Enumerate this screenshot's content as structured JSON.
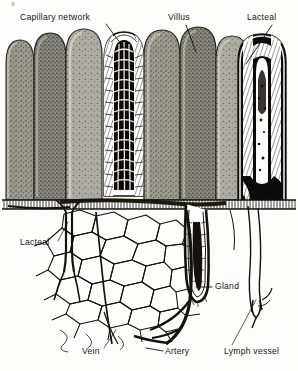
{
  "figure": {
    "kind": "anatomical-illustration",
    "style": "black-and-white engraving / stipple halftone",
    "background_color": "#fdfdfc",
    "ink_color": "#15120c",
    "tissue_gray": "#8d8a83",
    "tissue_gray_light": "#a8a59e",
    "tissue_gray_dark": "#6e6b64"
  },
  "labels": [
    {
      "id": "capillary-network",
      "text": "Capillary network",
      "x": 20,
      "y": 20,
      "anchor": "start"
    },
    {
      "id": "villus",
      "text": "Villus",
      "x": 168,
      "y": 20,
      "anchor": "start"
    },
    {
      "id": "lacteal-top",
      "text": "Lacteal",
      "x": 247,
      "y": 20,
      "anchor": "start"
    },
    {
      "id": "lacteal-left",
      "text": "Lacteal",
      "x": 20,
      "y": 245,
      "anchor": "start"
    },
    {
      "id": "gland",
      "text": "Gland",
      "x": 215,
      "y": 289,
      "anchor": "start"
    },
    {
      "id": "vein",
      "text": "Vein",
      "x": 82,
      "y": 354,
      "anchor": "start"
    },
    {
      "id": "artery",
      "text": "Artery",
      "x": 165,
      "y": 354,
      "anchor": "start"
    },
    {
      "id": "lymph-vessel",
      "text": "Lymph vessel",
      "x": 224,
      "y": 354,
      "anchor": "start"
    }
  ],
  "structures": [
    {
      "id": "villus-row",
      "name": "row of intestinal villi"
    },
    {
      "id": "villus-cutaway-mid",
      "name": "cut-open villus showing capillary network"
    },
    {
      "id": "villus-cutaway-right",
      "name": "cut-open villus showing lacteal"
    },
    {
      "id": "mucosa-base",
      "name": "mucosal base layer"
    },
    {
      "id": "capillary-plexus",
      "name": "submucosal capillary plexus"
    },
    {
      "id": "gland-tube",
      "name": "intestinal gland (crypt of Lieberkuhn)"
    },
    {
      "id": "artery-trunk",
      "name": "arterial trunk"
    },
    {
      "id": "vein-trunk",
      "name": "venous trunk"
    },
    {
      "id": "lymph-trunk",
      "name": "lymphatic vessel"
    }
  ]
}
